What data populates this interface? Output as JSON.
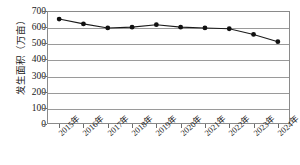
{
  "chart_data": {
    "type": "line",
    "title": "",
    "xlabel": "",
    "ylabel": "发生面积（万亩）",
    "categories": [
      "2015年",
      "2016年",
      "2017年",
      "2018年",
      "2019年",
      "2020年",
      "2021年",
      "2022年",
      "2023年",
      "2024年"
    ],
    "series": [
      {
        "name": "发生面积",
        "values": [
          650,
          620,
          595,
          600,
          615,
          600,
          595,
          590,
          555,
          510
        ]
      }
    ],
    "ylim": [
      0,
      700
    ],
    "ytick_values": [
      700,
      600,
      500,
      400,
      300,
      200,
      100,
      0
    ],
    "ytick_labels": [
      "700",
      "600",
      "500",
      "400",
      "300",
      "200",
      "100",
      "0"
    ],
    "grid": true,
    "legend": "none",
    "marker": "filled-circle",
    "line_color": "#1b1b1b",
    "marker_color": "#111111",
    "grid_color": "#9a9a9a",
    "axis_color": "#8a8a8a"
  }
}
